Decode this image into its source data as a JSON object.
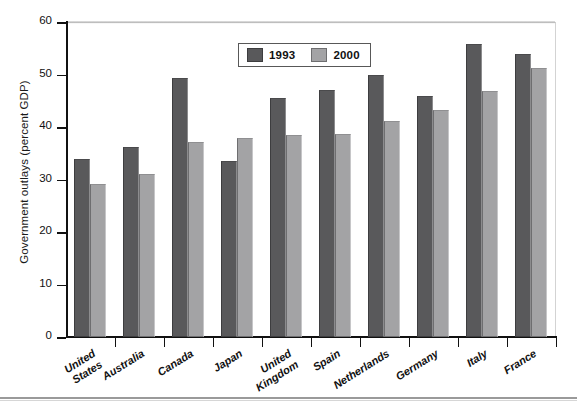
{
  "chart_data": {
    "type": "bar",
    "title": "",
    "xlabel": "",
    "ylabel": "Government outlays (percent GDP)",
    "ylim": [
      0,
      60
    ],
    "yticks": [
      0,
      10,
      20,
      30,
      40,
      50,
      60
    ],
    "grid": false,
    "legend_position": "top-center",
    "categories": [
      "United\nStates",
      "Australia",
      "Canada",
      "Japan",
      "United\nKingdom",
      "Spain",
      "Netherlands",
      "Germany",
      "Italy",
      "France"
    ],
    "series": [
      {
        "name": "1993",
        "color": "#59595b",
        "values": [
          34.0,
          36.1,
          49.3,
          33.5,
          45.6,
          47.1,
          50.0,
          46.0,
          55.8,
          53.9
        ]
      },
      {
        "name": "2000",
        "color": "#a3a3a5",
        "values": [
          29.2,
          31.1,
          37.1,
          38.0,
          38.5,
          38.6,
          41.2,
          43.3,
          46.8,
          51.3
        ]
      }
    ]
  },
  "legend": {
    "items": [
      {
        "label": "1993"
      },
      {
        "label": "2000"
      }
    ]
  },
  "axes": {
    "y_title": "Government outlays (percent GDP)",
    "y_tick_labels": [
      "60",
      "50",
      "40",
      "30",
      "20",
      "10",
      "0"
    ]
  },
  "colors": {
    "series_1993": "#59595b",
    "series_2000": "#a3a3a5",
    "axis": "#111111",
    "frame": "#d0d0d0"
  }
}
